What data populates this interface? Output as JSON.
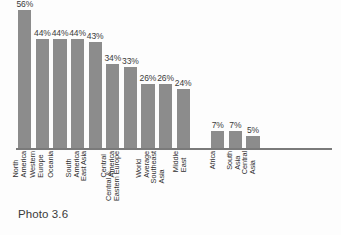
{
  "figure": {
    "caption": "Photo 3.6",
    "bar_color": "#8c8c8c",
    "axis_color": "#7a7a7a",
    "background_color": "#fdfdfd",
    "label_color": "#2f2f2f"
  },
  "chart_data": {
    "type": "bar",
    "title": "",
    "subtitle": "",
    "xlabel": "",
    "ylabel": "",
    "ylim": [
      0,
      60
    ],
    "grid": false,
    "legend": "none",
    "orientation": "vertical",
    "value_suffix": "%",
    "categories": [
      "North America",
      "Western Europe",
      "Oceania",
      "South America",
      "East Asia",
      "Central America",
      "Central & Eastern Europe",
      "World Average",
      "Southeast Asia",
      "Middle East",
      "Africa",
      "South Asia",
      "Central Asia"
    ],
    "values": [
      56,
      44,
      44,
      44,
      43,
      34,
      33,
      26,
      26,
      24,
      7,
      7,
      5
    ],
    "value_labels": [
      "56%",
      "44%",
      "44%",
      "44%",
      "43%",
      "34%",
      "33%",
      "26%",
      "26%",
      "24%",
      "7%",
      "7%",
      "5%"
    ],
    "category_lines": [
      [
        "North",
        "America"
      ],
      [
        "Western",
        "Europe"
      ],
      [
        "Oceania"
      ],
      [
        "South",
        "America"
      ],
      [
        "East Asia"
      ],
      [
        "Central",
        "America"
      ],
      [
        "Central &",
        "Eastern Europe"
      ],
      [
        "World",
        "Average"
      ],
      [
        "Southeast",
        "Asia"
      ],
      [
        "Middle",
        "East"
      ],
      [
        "Africa"
      ],
      [
        "South",
        "Asia"
      ],
      [
        "Central",
        "Asia"
      ]
    ]
  }
}
